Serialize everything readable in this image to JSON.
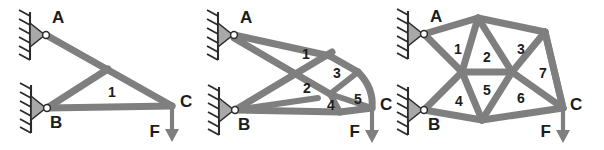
{
  "figure": {
    "background_color": "#ffffff",
    "member_color": "#7f7f7f",
    "support_color": "#a8a8a8",
    "text_color": "#1c1c1c",
    "panel_count": 3
  },
  "panels": [
    {
      "id": "panel-left",
      "name": "left-truss",
      "nodes": [
        {
          "id": "A",
          "label": "A",
          "x": 46,
          "y": 35,
          "support": "pin"
        },
        {
          "id": "B",
          "label": "B",
          "x": 47,
          "y": 108,
          "support": "pin"
        },
        {
          "id": "C",
          "label": "C",
          "x": 172,
          "y": 106,
          "support": "none"
        }
      ],
      "node_labels": [
        {
          "text": "A",
          "x": 52,
          "y": 19
        },
        {
          "text": "B",
          "x": 50,
          "y": 124
        },
        {
          "text": "C",
          "x": 180,
          "y": 103
        }
      ],
      "cell_labels": [
        {
          "text": "1",
          "x": 112,
          "y": 93
        }
      ],
      "force": {
        "label": "F",
        "label_x": 160,
        "label_y": 133,
        "x": 172,
        "y0": 108,
        "y1": 140
      }
    },
    {
      "id": "panel-middle",
      "name": "middle-truss",
      "nodes": [
        {
          "id": "A",
          "label": "A",
          "x": 234,
          "y": 35,
          "support": "pin"
        },
        {
          "id": "B",
          "label": "B",
          "x": 235,
          "y": 110,
          "support": "pin"
        },
        {
          "id": "C",
          "label": "C",
          "x": 372,
          "y": 108,
          "support": "none"
        }
      ],
      "node_labels": [
        {
          "text": "A",
          "x": 240,
          "y": 19
        },
        {
          "text": "B",
          "x": 238,
          "y": 126
        },
        {
          "text": "C",
          "x": 380,
          "y": 106
        }
      ],
      "cell_labels": [
        {
          "text": "1",
          "x": 306,
          "y": 55
        },
        {
          "text": "2",
          "x": 307,
          "y": 89
        },
        {
          "text": "3",
          "x": 337,
          "y": 74
        },
        {
          "text": "4",
          "x": 331,
          "y": 106
        },
        {
          "text": "5",
          "x": 358,
          "y": 100
        }
      ],
      "force": {
        "label": "F",
        "label_x": 362,
        "label_y": 133,
        "x": 372,
        "y0": 110,
        "y1": 142
      }
    },
    {
      "id": "panel-right",
      "name": "right-truss",
      "nodes": [
        {
          "id": "A",
          "label": "A",
          "x": 424,
          "y": 34,
          "support": "pin"
        },
        {
          "id": "B",
          "label": "B",
          "x": 424,
          "y": 110,
          "support": "pin"
        },
        {
          "id": "C",
          "label": "C",
          "x": 563,
          "y": 108,
          "support": "none"
        }
      ],
      "node_labels": [
        {
          "text": "A",
          "x": 430,
          "y": 18
        },
        {
          "text": "B",
          "x": 428,
          "y": 126
        },
        {
          "text": "C",
          "x": 570,
          "y": 106
        }
      ],
      "cell_labels": [
        {
          "text": "1",
          "x": 458,
          "y": 50
        },
        {
          "text": "2",
          "x": 487,
          "y": 58
        },
        {
          "text": "3",
          "x": 521,
          "y": 50
        },
        {
          "text": "4",
          "x": 459,
          "y": 102
        },
        {
          "text": "5",
          "x": 487,
          "y": 91
        },
        {
          "text": "6",
          "x": 521,
          "y": 99
        },
        {
          "text": "7",
          "x": 543,
          "y": 74
        }
      ],
      "force": {
        "label": "F",
        "label_x": 552,
        "label_y": 133,
        "x": 563,
        "y0": 110,
        "y1": 142
      }
    }
  ]
}
